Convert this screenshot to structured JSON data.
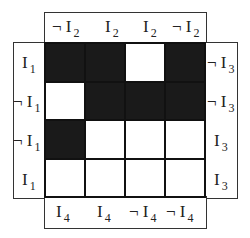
{
  "diagram": {
    "type": "karnaugh-map",
    "top_labels": [
      {
        "neg": true,
        "var": "I",
        "sub": "2"
      },
      {
        "neg": false,
        "var": "I",
        "sub": "2"
      },
      {
        "neg": false,
        "var": "I",
        "sub": "2"
      },
      {
        "neg": true,
        "var": "I",
        "sub": "2"
      }
    ],
    "left_labels": [
      {
        "neg": false,
        "var": "I",
        "sub": "1"
      },
      {
        "neg": true,
        "var": "I",
        "sub": "1"
      },
      {
        "neg": true,
        "var": "I",
        "sub": "1"
      },
      {
        "neg": false,
        "var": "I",
        "sub": "1"
      }
    ],
    "right_labels": [
      {
        "neg": true,
        "var": "I",
        "sub": "3"
      },
      {
        "neg": true,
        "var": "I",
        "sub": "3"
      },
      {
        "neg": false,
        "var": "I",
        "sub": "3"
      },
      {
        "neg": false,
        "var": "I",
        "sub": "3"
      }
    ],
    "bottom_labels": [
      {
        "neg": false,
        "var": "I",
        "sub": "4"
      },
      {
        "neg": false,
        "var": "I",
        "sub": "4"
      },
      {
        "neg": true,
        "var": "I",
        "sub": "4"
      },
      {
        "neg": true,
        "var": "I",
        "sub": "4"
      }
    ],
    "cells": [
      [
        1,
        1,
        0,
        1
      ],
      [
        0,
        1,
        1,
        1
      ],
      [
        1,
        0,
        0,
        0
      ],
      [
        0,
        0,
        0,
        0
      ]
    ],
    "colors": {
      "filled": "#1a1a1a",
      "empty": "#ffffff",
      "border": "#111111"
    }
  }
}
